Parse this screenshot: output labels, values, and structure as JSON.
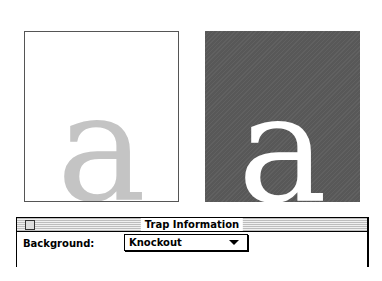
{
  "illustration": {
    "left_panel": {
      "glyph": "a",
      "background": "#ffffff",
      "glyph_color": "#c4c4c4"
    },
    "right_panel": {
      "glyph": "a",
      "background": "#585858",
      "glyph_color": "#ffffff"
    }
  },
  "window": {
    "title": "Trap Information",
    "background_label": "Background:",
    "background_select": {
      "value": "Knockout"
    }
  }
}
